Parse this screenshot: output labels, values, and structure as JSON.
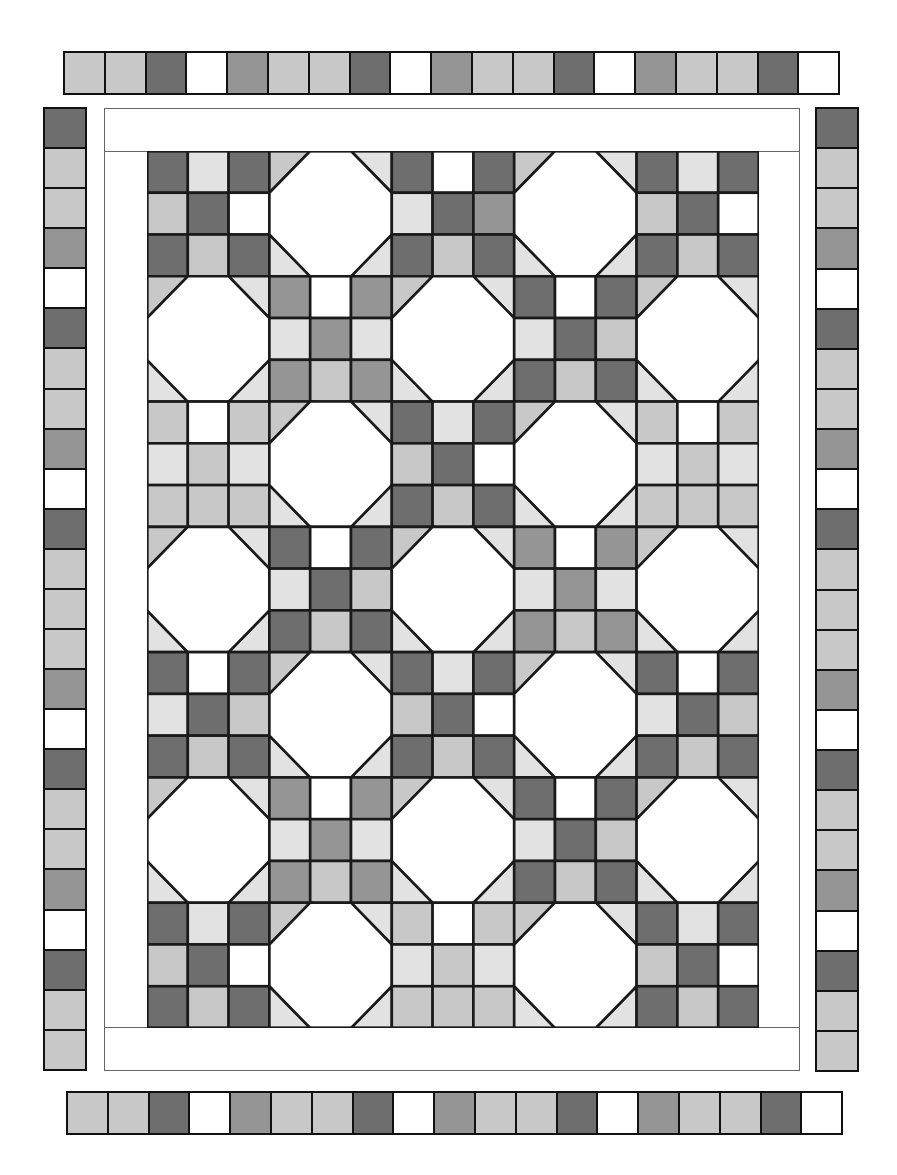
{
  "diagram": {
    "palette": {
      "D": "#6e6e6e",
      "M": "#959595",
      "L": "#c8c8c8",
      "X": "#e2e2e2",
      "W": "#ffffff",
      "line": "#1a1a1a"
    },
    "top_border": [
      "L",
      "L",
      "D",
      "W",
      "M",
      "L",
      "L",
      "D",
      "W",
      "M",
      "L",
      "L",
      "D",
      "W",
      "M",
      "L",
      "L",
      "D",
      "W"
    ],
    "bottom_border": [
      "L",
      "L",
      "D",
      "W",
      "M",
      "L",
      "L",
      "D",
      "W",
      "M",
      "L",
      "L",
      "D",
      "W",
      "M",
      "L",
      "L",
      "D",
      "W"
    ],
    "left_border": [
      "D",
      "L",
      "L",
      "M",
      "W",
      "D",
      "L",
      "L",
      "M",
      "W",
      "D",
      "L",
      "L",
      "L",
      "M",
      "W",
      "D",
      "L",
      "L",
      "M",
      "W",
      "D",
      "L",
      "L"
    ],
    "right_border": [
      "D",
      "L",
      "L",
      "M",
      "W",
      "D",
      "L",
      "L",
      "M",
      "W",
      "D",
      "L",
      "L",
      "L",
      "M",
      "W",
      "D",
      "L",
      "L",
      "M",
      "W",
      "D",
      "L",
      "L"
    ],
    "grid": {
      "cols": 5,
      "rows": 7,
      "blocks": [
        [
          {
            "type": "ninepatch",
            "cells": [
              "D",
              "X",
              "D",
              "L",
              "D",
              "W",
              "D",
              "L",
              "D"
            ]
          },
          {
            "type": "snowball",
            "corners": [
              "L",
              "X",
              "X",
              "X"
            ]
          },
          {
            "type": "ninepatch",
            "cells": [
              "D",
              "W",
              "D",
              "X",
              "D",
              "M",
              "D",
              "L",
              "D"
            ]
          },
          {
            "type": "snowball",
            "corners": [
              "L",
              "X",
              "X",
              "X"
            ]
          },
          {
            "type": "ninepatch",
            "cells": [
              "D",
              "X",
              "D",
              "L",
              "D",
              "W",
              "D",
              "L",
              "D"
            ]
          }
        ],
        [
          {
            "type": "snowball",
            "corners": [
              "L",
              "X",
              "X",
              "X"
            ]
          },
          {
            "type": "ninepatch",
            "cells": [
              "M",
              "W",
              "M",
              "X",
              "M",
              "X",
              "M",
              "L",
              "M"
            ]
          },
          {
            "type": "snowball",
            "corners": [
              "L",
              "X",
              "X",
              "X"
            ]
          },
          {
            "type": "ninepatch",
            "cells": [
              "D",
              "W",
              "D",
              "X",
              "D",
              "L",
              "D",
              "L",
              "D"
            ]
          },
          {
            "type": "snowball",
            "corners": [
              "L",
              "X",
              "X",
              "X"
            ]
          }
        ],
        [
          {
            "type": "ninepatch",
            "cells": [
              "L",
              "W",
              "L",
              "X",
              "L",
              "X",
              "L",
              "L",
              "L"
            ]
          },
          {
            "type": "snowball",
            "corners": [
              "L",
              "X",
              "X",
              "X"
            ]
          },
          {
            "type": "ninepatch",
            "cells": [
              "D",
              "X",
              "D",
              "L",
              "D",
              "W",
              "D",
              "L",
              "D"
            ]
          },
          {
            "type": "snowball",
            "corners": [
              "L",
              "X",
              "X",
              "X"
            ]
          },
          {
            "type": "ninepatch",
            "cells": [
              "L",
              "W",
              "L",
              "X",
              "L",
              "X",
              "L",
              "L",
              "L"
            ]
          }
        ],
        [
          {
            "type": "snowball",
            "corners": [
              "L",
              "X",
              "X",
              "X"
            ]
          },
          {
            "type": "ninepatch",
            "cells": [
              "D",
              "W",
              "D",
              "X",
              "D",
              "L",
              "D",
              "L",
              "D"
            ]
          },
          {
            "type": "snowball",
            "corners": [
              "L",
              "X",
              "X",
              "X"
            ]
          },
          {
            "type": "ninepatch",
            "cells": [
              "M",
              "W",
              "M",
              "X",
              "M",
              "X",
              "M",
              "L",
              "M"
            ]
          },
          {
            "type": "snowball",
            "corners": [
              "L",
              "X",
              "X",
              "X"
            ]
          }
        ],
        [
          {
            "type": "ninepatch",
            "cells": [
              "D",
              "W",
              "D",
              "X",
              "D",
              "L",
              "D",
              "L",
              "D"
            ]
          },
          {
            "type": "snowball",
            "corners": [
              "L",
              "X",
              "X",
              "X"
            ]
          },
          {
            "type": "ninepatch",
            "cells": [
              "D",
              "X",
              "D",
              "L",
              "D",
              "W",
              "D",
              "L",
              "D"
            ]
          },
          {
            "type": "snowball",
            "corners": [
              "L",
              "X",
              "X",
              "X"
            ]
          },
          {
            "type": "ninepatch",
            "cells": [
              "D",
              "W",
              "D",
              "X",
              "D",
              "L",
              "D",
              "L",
              "D"
            ]
          }
        ],
        [
          {
            "type": "snowball",
            "corners": [
              "L",
              "X",
              "X",
              "X"
            ]
          },
          {
            "type": "ninepatch",
            "cells": [
              "M",
              "W",
              "M",
              "X",
              "M",
              "X",
              "M",
              "L",
              "M"
            ]
          },
          {
            "type": "snowball",
            "corners": [
              "L",
              "X",
              "X",
              "X"
            ]
          },
          {
            "type": "ninepatch",
            "cells": [
              "D",
              "W",
              "D",
              "X",
              "D",
              "L",
              "D",
              "L",
              "D"
            ]
          },
          {
            "type": "snowball",
            "corners": [
              "L",
              "X",
              "X",
              "X"
            ]
          }
        ],
        [
          {
            "type": "ninepatch",
            "cells": [
              "D",
              "X",
              "D",
              "L",
              "D",
              "W",
              "D",
              "L",
              "D"
            ]
          },
          {
            "type": "snowball",
            "corners": [
              "L",
              "X",
              "X",
              "X"
            ]
          },
          {
            "type": "ninepatch",
            "cells": [
              "L",
              "W",
              "L",
              "X",
              "L",
              "X",
              "L",
              "L",
              "L"
            ]
          },
          {
            "type": "snowball",
            "corners": [
              "L",
              "X",
              "X",
              "X"
            ]
          },
          {
            "type": "ninepatch",
            "cells": [
              "D",
              "X",
              "D",
              "L",
              "D",
              "W",
              "D",
              "L",
              "D"
            ]
          }
        ]
      ]
    }
  }
}
